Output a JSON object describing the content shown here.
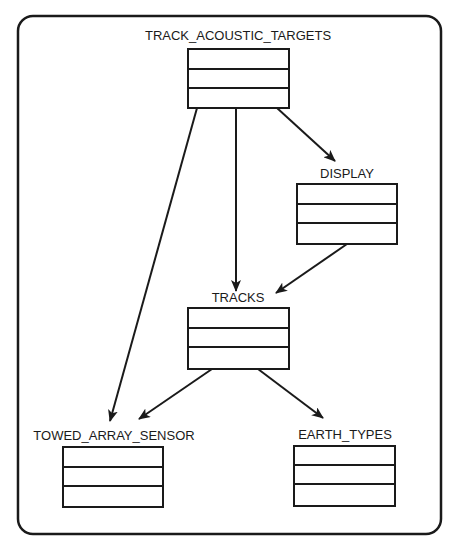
{
  "diagram": {
    "type": "entity-dependency",
    "colors": {
      "stroke": "#1a1a1a",
      "background": "#ffffff"
    },
    "nodes": [
      {
        "id": "track_acoustic_targets",
        "label": "TRACK_ACOUSTIC_TARGETS",
        "rows": 3
      },
      {
        "id": "display",
        "label": "DISPLAY",
        "rows": 3
      },
      {
        "id": "tracks",
        "label": "TRACKS",
        "rows": 3
      },
      {
        "id": "towed_array_sensor",
        "label": "TOWED_ARRAY_SENSOR",
        "rows": 3
      },
      {
        "id": "earth_types",
        "label": "EARTH_TYPES",
        "rows": 3
      }
    ],
    "edges": [
      {
        "from": "track_acoustic_targets",
        "to": "towed_array_sensor"
      },
      {
        "from": "track_acoustic_targets",
        "to": "tracks"
      },
      {
        "from": "track_acoustic_targets",
        "to": "display"
      },
      {
        "from": "display",
        "to": "tracks"
      },
      {
        "from": "tracks",
        "to": "towed_array_sensor"
      },
      {
        "from": "tracks",
        "to": "earth_types"
      }
    ]
  }
}
